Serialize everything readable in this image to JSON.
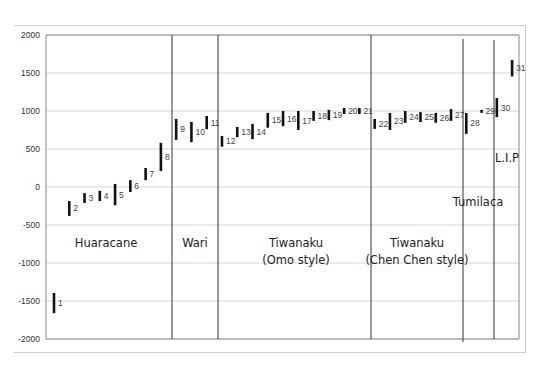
{
  "chart_data": {
    "type": "range_bar",
    "title": "",
    "xlabel": "",
    "ylabel": "",
    "ylim": [
      -2000,
      2000
    ],
    "yticks": [
      2000,
      1500,
      1000,
      500,
      0,
      -500,
      -1000,
      -1500,
      -2000
    ],
    "grid": true,
    "legend": null,
    "series": [
      {
        "id": 1,
        "low": -1660,
        "high": -1395
      },
      {
        "id": 2,
        "low": -380,
        "high": -185
      },
      {
        "id": 3,
        "low": -210,
        "high": -80
      },
      {
        "id": 4,
        "low": -185,
        "high": -50
      },
      {
        "id": 5,
        "low": -240,
        "high": 40
      },
      {
        "id": 6,
        "low": -65,
        "high": 90
      },
      {
        "id": 7,
        "low": 90,
        "high": 250
      },
      {
        "id": 8,
        "low": 210,
        "high": 580
      },
      {
        "id": 9,
        "low": 620,
        "high": 895
      },
      {
        "id": 10,
        "low": 590,
        "high": 855
      },
      {
        "id": 11,
        "low": 760,
        "high": 935
      },
      {
        "id": 12,
        "low": 530,
        "high": 670
      },
      {
        "id": 13,
        "low": 655,
        "high": 790
      },
      {
        "id": 14,
        "low": 630,
        "high": 830
      },
      {
        "id": 15,
        "low": 780,
        "high": 975
      },
      {
        "id": 16,
        "low": 800,
        "high": 1000
      },
      {
        "id": 17,
        "low": 750,
        "high": 1000
      },
      {
        "id": 18,
        "low": 870,
        "high": 1000
      },
      {
        "id": 19,
        "low": 880,
        "high": 1015
      },
      {
        "id": 20,
        "low": 960,
        "high": 1040
      },
      {
        "id": 21,
        "low": 960,
        "high": 1040
      },
      {
        "id": 22,
        "low": 765,
        "high": 895
      },
      {
        "id": 23,
        "low": 750,
        "high": 975
      },
      {
        "id": 24,
        "low": 845,
        "high": 1000
      },
      {
        "id": 25,
        "low": 855,
        "high": 985
      },
      {
        "id": 26,
        "low": 845,
        "high": 975
      },
      {
        "id": 27,
        "low": 870,
        "high": 1025
      },
      {
        "id": 28,
        "low": 700,
        "high": 975
      },
      {
        "id": 29,
        "low": 975,
        "high": 1015
      },
      {
        "id": 30,
        "low": 920,
        "high": 1170
      },
      {
        "id": 31,
        "low": 1455,
        "high": 1670
      }
    ],
    "dividers": [
      {
        "after_bar": 8,
        "x_px": 172
      },
      {
        "after_bar": 11,
        "x_px": 218
      },
      {
        "after_bar": 21,
        "x_px": 371
      },
      {
        "after_bar": 27,
        "x_px": 463
      },
      {
        "after_bar": 29,
        "x_px": 494
      }
    ],
    "annotations": [
      {
        "text": "Huaracane",
        "x_px": 106,
        "y_px": 243
      },
      {
        "text": "Wari",
        "x_px": 195,
        "y_px": 243
      },
      {
        "text": "Tiwanaku",
        "line2": "(Omo style)",
        "x_px": 296,
        "y_px": 243
      },
      {
        "text": "Tiwanaku",
        "line2": "(Chen Chen style)",
        "x_px": 416,
        "y_px": 243
      },
      {
        "text": "Tumilaca",
        "x_px": 478,
        "y_px": 206
      },
      {
        "text": "L.I.P",
        "x_px": 507,
        "y_px": 158
      }
    ]
  },
  "labels": {
    "huaracane": "Huaracane",
    "wari": "Wari",
    "omo1": "Tiwanaku",
    "omo2": "(Omo style)",
    "chen1": "Tiwanaku",
    "chen2": "(Chen Chen style)",
    "tumilaca": "Tumilaca",
    "lip": "L.I.P"
  }
}
